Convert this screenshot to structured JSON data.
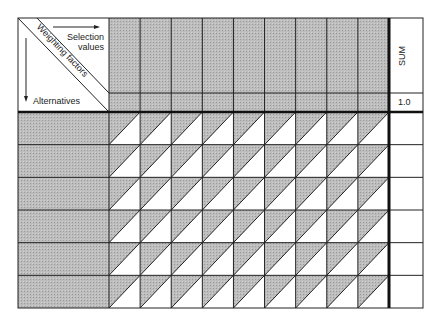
{
  "corner": {
    "selection_label_line1": "Selection",
    "selection_label_line2": "values",
    "weighting_label": "Weighting factors",
    "alternatives_label": "Alternatives"
  },
  "sum_column": {
    "header": "SUM",
    "weights_total": "1.0"
  },
  "grid": {
    "criteria_columns": 9,
    "alternative_rows": 6
  },
  "colors": {
    "shaded": "#b8b8b8",
    "line": "#222222"
  }
}
